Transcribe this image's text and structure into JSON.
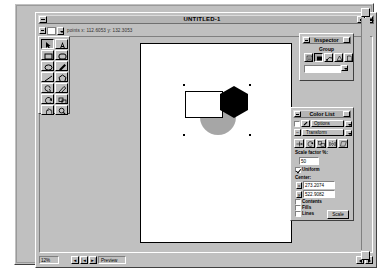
{
  "window": {
    "title": "UNTITLED-1",
    "coordinate_readout": "points    x: 112.6053   y: 132.3053",
    "zoom_label": "12%",
    "preview_label": "Preview"
  },
  "palette": {
    "tools": [
      {
        "name": "pointer-tool",
        "icon": "arrow-pointer-icon",
        "selected": true
      },
      {
        "name": "text-tool",
        "icon": "letter-a-icon",
        "selected": false
      },
      {
        "name": "rectangle-tool",
        "icon": "rectangle-icon",
        "selected": false
      },
      {
        "name": "rounded-rect-tool",
        "icon": "rounded-rectangle-icon",
        "selected": false
      },
      {
        "name": "ellipse-tool",
        "icon": "ellipse-icon",
        "selected": false
      },
      {
        "name": "pen-tool",
        "icon": "pen-icon",
        "selected": false
      },
      {
        "name": "line-tool",
        "icon": "line-icon",
        "selected": false
      },
      {
        "name": "polygon-tool",
        "icon": "polygon-icon",
        "selected": false
      },
      {
        "name": "spiral-tool",
        "icon": "spiral-icon",
        "selected": false
      },
      {
        "name": "knife-tool",
        "icon": "knife-icon",
        "selected": false
      },
      {
        "name": "rotate-tool",
        "icon": "rotate-icon",
        "selected": false
      },
      {
        "name": "scale-tool",
        "icon": "scale-icon",
        "selected": false
      },
      {
        "name": "hand-tool",
        "icon": "hand-icon",
        "selected": false
      },
      {
        "name": "zoom-tool",
        "icon": "magnifier-icon",
        "selected": false
      }
    ]
  },
  "canvas": {
    "shapes": [
      {
        "name": "white-rectangle",
        "type": "rect",
        "fill": "#ffffff",
        "stroke": "#000000"
      },
      {
        "name": "gray-circle",
        "type": "circle",
        "fill": "#a6a6a6"
      },
      {
        "name": "black-hexagon",
        "type": "hexagon",
        "fill": "#000000"
      }
    ]
  },
  "inspector": {
    "title": "Inspector",
    "object_type": "Group",
    "icons": [
      {
        "name": "object-info-icon",
        "selected": false
      },
      {
        "name": "fill-inspector-icon",
        "selected": true
      },
      {
        "name": "stroke-inspector-icon",
        "selected": false
      },
      {
        "name": "halftone-inspector-icon",
        "selected": false
      },
      {
        "name": "layer-inspector-icon",
        "selected": false
      }
    ],
    "combo_value": ""
  },
  "color_list": {
    "title": "Color List",
    "options_label": "Options",
    "transform_label": "Transform",
    "transform_buttons": [
      {
        "name": "move-transform-button"
      },
      {
        "name": "rotate-transform-button"
      },
      {
        "name": "scale-transform-button"
      },
      {
        "name": "reflect-transform-button"
      },
      {
        "name": "skew-transform-button"
      }
    ],
    "scale_factor_label": "Scale factor %:",
    "scale_factor_value": "50",
    "uniform_label": "Uniform",
    "uniform_checked": true,
    "center_label": "Center:",
    "center_x_axis": "x",
    "center_x_value": "273.2074",
    "center_y_axis": "y",
    "center_y_value": "522.9082",
    "contents_label": "Contents",
    "contents_checked": false,
    "fills_label": "Fills",
    "fills_checked": false,
    "lines_label": "Lines",
    "lines_checked": false,
    "apply_button": "Scale"
  }
}
